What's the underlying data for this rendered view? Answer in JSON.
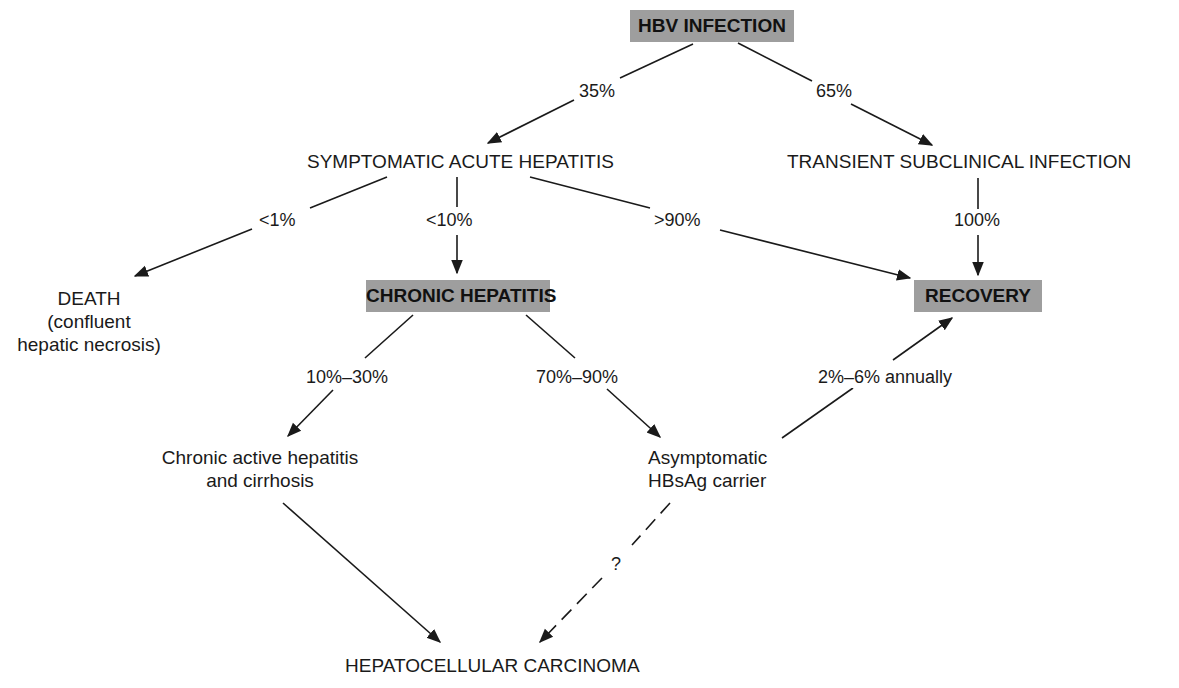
{
  "diagram": {
    "nodes": {
      "hbv_infection": "HBV INFECTION",
      "symptomatic_acute_hepatitis": "SYMPTOMATIC ACUTE HEPATITIS",
      "transient_subclinical_infection": "TRANSIENT SUBCLINICAL INFECTION",
      "death": {
        "line1": "DEATH",
        "line2": "(confluent",
        "line3": "hepatic necrosis)"
      },
      "chronic_hepatitis": "CHRONIC HEPATITIS",
      "recovery": "RECOVERY",
      "chronic_active_hepatitis": {
        "line1": "Chronic active hepatitis",
        "line2": "and cirrhosis"
      },
      "asymptomatic_carrier": {
        "line1": "Asymptomatic",
        "line2": "HBsAg carrier"
      },
      "hepatocellular_carcinoma": "HEPATOCELLULAR CARCINOMA"
    },
    "edges": [
      {
        "from": "HBV INFECTION",
        "to": "SYMPTOMATIC ACUTE HEPATITIS",
        "label": "35%"
      },
      {
        "from": "HBV INFECTION",
        "to": "TRANSIENT SUBCLINICAL INFECTION",
        "label": "65%"
      },
      {
        "from": "SYMPTOMATIC ACUTE HEPATITIS",
        "to": "DEATH",
        "label": "<1%"
      },
      {
        "from": "SYMPTOMATIC ACUTE HEPATITIS",
        "to": "CHRONIC HEPATITIS",
        "label": "<10%"
      },
      {
        "from": "SYMPTOMATIC ACUTE HEPATITIS",
        "to": "RECOVERY",
        "label": ">90%"
      },
      {
        "from": "TRANSIENT SUBCLINICAL INFECTION",
        "to": "RECOVERY",
        "label": "100%"
      },
      {
        "from": "CHRONIC HEPATITIS",
        "to": "Chronic active hepatitis and cirrhosis",
        "label": "10%–30%"
      },
      {
        "from": "CHRONIC HEPATITIS",
        "to": "Asymptomatic HBsAg carrier",
        "label": "70%–90%"
      },
      {
        "from": "Asymptomatic HBsAg carrier",
        "to": "RECOVERY",
        "label": "2%–6% annually"
      },
      {
        "from": "Chronic active hepatitis and cirrhosis",
        "to": "HEPATOCELLULAR CARCINOMA",
        "label": ""
      },
      {
        "from": "Asymptomatic HBsAg carrier",
        "to": "HEPATOCELLULAR CARCINOMA",
        "label": "?",
        "style": "dashed"
      }
    ],
    "colors": {
      "box_fill": "#9e9e9e",
      "line": "#1a1a1a",
      "background": "#ffffff"
    }
  }
}
